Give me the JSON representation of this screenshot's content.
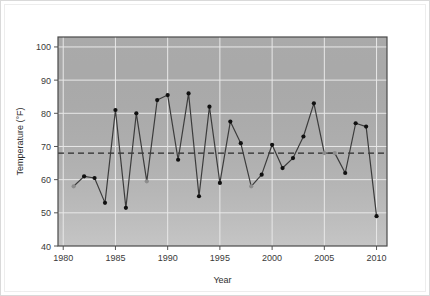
{
  "chart_data": {
    "type": "line",
    "title": "",
    "xlabel": "Year",
    "ylabel": "Temperature (°F)",
    "xlim": [
      1979.5,
      2011
    ],
    "ylim": [
      40,
      103
    ],
    "xticks": [
      1980,
      1985,
      1990,
      1995,
      2000,
      2005,
      2010
    ],
    "yticks": [
      40,
      50,
      60,
      70,
      80,
      90,
      100
    ],
    "grid": true,
    "legend": null,
    "plot_bgcolor": "#b5b5b5",
    "grid_color": "#e8e8e8",
    "line_color": "#3c3c3c",
    "marker_color": "#101010",
    "marker_color_alt": "#8c8c8c",
    "reference_line": {
      "value": 68,
      "style": "dashed",
      "color": "#2b2b2b"
    },
    "x": [
      1981,
      1982,
      1983,
      1984,
      1985,
      1986,
      1987,
      1988,
      1989,
      1990,
      1991,
      1992,
      1993,
      1994,
      1995,
      1996,
      1997,
      1998,
      1999,
      2000,
      2001,
      2002,
      2003,
      2004,
      2005,
      2006,
      2007,
      2008,
      2009,
      2010
    ],
    "values": [
      58,
      61,
      60.5,
      53,
      81,
      51.5,
      80,
      59.5,
      84,
      85.5,
      66,
      86,
      55,
      82,
      59,
      77.5,
      71,
      58,
      61.5,
      70.5,
      63.5,
      66.5,
      73,
      83,
      68,
      68,
      62,
      77,
      76,
      49
    ],
    "marker_shades": [
      "alt",
      "dark",
      "dark",
      "dark",
      "dark",
      "dark",
      "dark",
      "alt",
      "dark",
      "dark",
      "dark",
      "dark",
      "dark",
      "dark",
      "dark",
      "dark",
      "dark",
      "alt",
      "dark",
      "dark",
      "dark",
      "dark",
      "dark",
      "dark",
      "alt",
      "alt",
      "dark",
      "dark",
      "dark",
      "dark"
    ]
  }
}
